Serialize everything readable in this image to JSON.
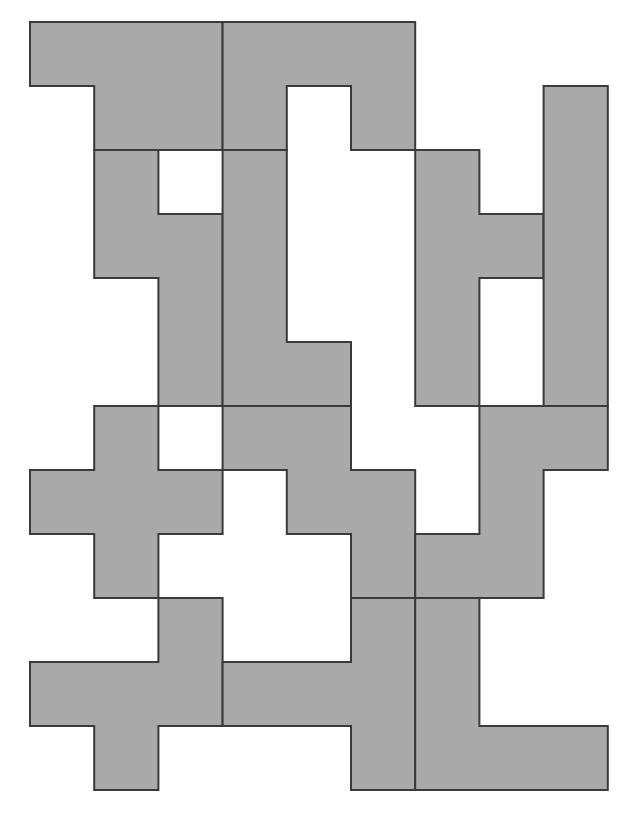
{
  "diagram": {
    "title": "",
    "fill_color": "#a9a9a9",
    "stroke_color": "#3a3a3a",
    "grid": {
      "origin_x": 30,
      "origin_y": 22,
      "cell": 64.2,
      "cols": 9,
      "rows": 12
    },
    "pieces": [
      {
        "id": "p1",
        "cells": [
          [
            0,
            0
          ],
          [
            3,
            0
          ],
          [
            3,
            2
          ],
          [
            1,
            2
          ],
          [
            1,
            1
          ],
          [
            0,
            1
          ]
        ]
      },
      {
        "id": "p2",
        "cells": [
          [
            3,
            0
          ],
          [
            6,
            0
          ],
          [
            6,
            2
          ],
          [
            5,
            2
          ],
          [
            5,
            1
          ],
          [
            4,
            1
          ],
          [
            4,
            2
          ],
          [
            3,
            2
          ]
        ]
      },
      {
        "id": "p3",
        "cells": [
          [
            1,
            2
          ],
          [
            2,
            2
          ],
          [
            2,
            3
          ],
          [
            3,
            3
          ],
          [
            3,
            6
          ],
          [
            2,
            6
          ],
          [
            2,
            4
          ],
          [
            1,
            4
          ]
        ]
      },
      {
        "id": "p4",
        "cells": [
          [
            3,
            2
          ],
          [
            4,
            2
          ],
          [
            4,
            5
          ],
          [
            5,
            5
          ],
          [
            5,
            6
          ],
          [
            3,
            6
          ]
        ]
      },
      {
        "id": "p5",
        "cells": [
          [
            6,
            2
          ],
          [
            7,
            2
          ],
          [
            7,
            3
          ],
          [
            8,
            3
          ],
          [
            8,
            4
          ],
          [
            7,
            4
          ],
          [
            7,
            6
          ],
          [
            6,
            6
          ]
        ]
      },
      {
        "id": "p6",
        "cells": [
          [
            8,
            1
          ],
          [
            9,
            1
          ],
          [
            9,
            6
          ],
          [
            8,
            6
          ]
        ]
      },
      {
        "id": "p7",
        "cells": [
          [
            1,
            6
          ],
          [
            2,
            6
          ],
          [
            2,
            7
          ],
          [
            3,
            7
          ],
          [
            3,
            8
          ],
          [
            2,
            8
          ],
          [
            2,
            9
          ],
          [
            1,
            9
          ],
          [
            1,
            8
          ],
          [
            0,
            8
          ],
          [
            0,
            7
          ],
          [
            1,
            7
          ]
        ]
      },
      {
        "id": "p8",
        "cells": [
          [
            3,
            6
          ],
          [
            5,
            6
          ],
          [
            5,
            7
          ],
          [
            6,
            7
          ],
          [
            6,
            9
          ],
          [
            5,
            9
          ],
          [
            5,
            8
          ],
          [
            4,
            8
          ],
          [
            4,
            7
          ],
          [
            3,
            7
          ]
        ]
      },
      {
        "id": "p9",
        "cells": [
          [
            7,
            6
          ],
          [
            9,
            6
          ],
          [
            9,
            7
          ],
          [
            8,
            7
          ],
          [
            8,
            9
          ],
          [
            6,
            9
          ],
          [
            6,
            8
          ],
          [
            7,
            8
          ]
        ]
      },
      {
        "id": "p10",
        "cells": [
          [
            2,
            9
          ],
          [
            3,
            9
          ],
          [
            3,
            11
          ],
          [
            2,
            11
          ],
          [
            2,
            12
          ],
          [
            1,
            12
          ],
          [
            1,
            11
          ],
          [
            0,
            11
          ],
          [
            0,
            10
          ],
          [
            2,
            10
          ]
        ]
      },
      {
        "id": "p11",
        "cells": [
          [
            5,
            9
          ],
          [
            6,
            9
          ],
          [
            6,
            12
          ],
          [
            5,
            12
          ],
          [
            5,
            11
          ],
          [
            3,
            11
          ],
          [
            3,
            10
          ],
          [
            5,
            10
          ]
        ]
      },
      {
        "id": "p12",
        "cells": [
          [
            6,
            9
          ],
          [
            7,
            9
          ],
          [
            7,
            11
          ],
          [
            9,
            11
          ],
          [
            9,
            12
          ],
          [
            6,
            12
          ]
        ]
      }
    ]
  }
}
